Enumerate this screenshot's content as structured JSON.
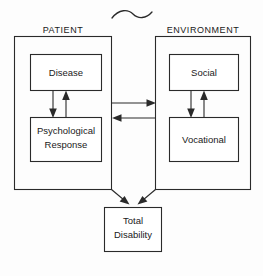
{
  "diagram": {
    "title_symbol": "tilde-squiggle",
    "colors": {
      "stroke": "#2a2a2a",
      "background": "#ffffff",
      "text": "#1a1a1a"
    },
    "groups": [
      {
        "id": "patient",
        "label": "PATIENT",
        "boxes": [
          {
            "id": "disease",
            "label": "Disease"
          },
          {
            "id": "psychological-response",
            "label_line1": "Psychological",
            "label_line2": "Response"
          }
        ]
      },
      {
        "id": "environment",
        "label": "ENVIRONMENT",
        "boxes": [
          {
            "id": "social",
            "label": "Social"
          },
          {
            "id": "vocational",
            "label": "Vocational"
          }
        ]
      }
    ],
    "outcome": {
      "id": "total-disability",
      "label_line1": "Total",
      "label_line2": "Disability"
    },
    "connections": [
      {
        "from": "disease",
        "to": "psychological-response",
        "direction": "down"
      },
      {
        "from": "psychological-response",
        "to": "disease",
        "direction": "up"
      },
      {
        "from": "social",
        "to": "vocational",
        "direction": "down"
      },
      {
        "from": "vocational",
        "to": "social",
        "direction": "up"
      },
      {
        "from": "patient",
        "to": "environment",
        "direction": "right"
      },
      {
        "from": "environment",
        "to": "patient",
        "direction": "left"
      },
      {
        "from": "patient",
        "to": "total-disability",
        "direction": "diagonal-down-right"
      },
      {
        "from": "environment",
        "to": "total-disability",
        "direction": "diagonal-down-left"
      }
    ]
  }
}
